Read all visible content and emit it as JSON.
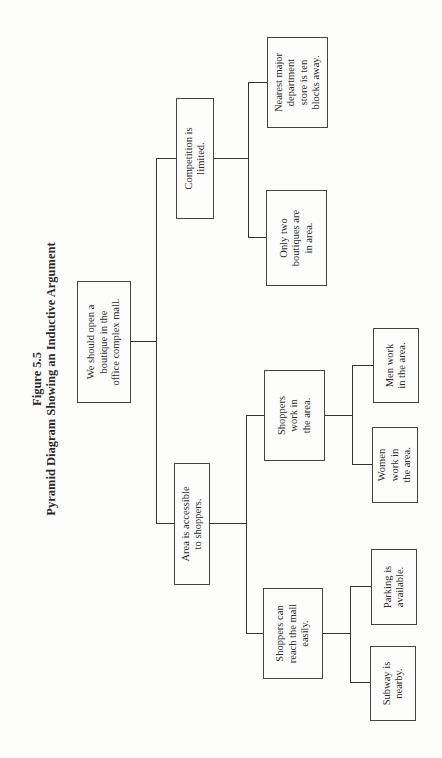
{
  "figure": {
    "number": "Figure 5.5",
    "title": "Pyramid Diagram Showing an Inductive Argument"
  },
  "diagram": {
    "root": {
      "text": "We should open a\nboutique in the\noffice complex mall."
    },
    "level1": [
      {
        "text": "Area is accessible\nto shoppers."
      },
      {
        "text": "Competition is\nlimited."
      }
    ],
    "level2": [
      {
        "text": "Shoppers can\nreach the mall\neasily."
      },
      {
        "text": "Shoppers\nwork in\nthe area."
      },
      {
        "text": "Only two\nboutiques are\nin area."
      },
      {
        "text": "Nearest major\ndepartment\nstore is ten\nblocks away."
      }
    ],
    "level3": [
      {
        "text": "Subway is\nnearby."
      },
      {
        "text": "Parking is\navailable."
      },
      {
        "text": "Women\nwork in\nthe area."
      },
      {
        "text": "Men work\nin the area."
      }
    ]
  }
}
